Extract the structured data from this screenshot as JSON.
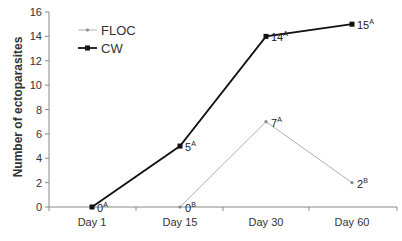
{
  "chart_data": {
    "type": "line",
    "title": "",
    "xlabel": "",
    "ylabel": "Number of ectoparasites",
    "categories": [
      "Day 1",
      "Day 15",
      "Day 30",
      "Day 60"
    ],
    "ylim": [
      0,
      16
    ],
    "yticks": [
      0,
      2,
      4,
      6,
      8,
      10,
      12,
      14,
      16
    ],
    "grid": false,
    "legend_position": "upper-left",
    "series": [
      {
        "name": "FLOC",
        "color": "#b0b0b0",
        "marker": "small-diamond",
        "values": [
          null,
          0,
          7,
          2
        ],
        "labels": [
          "",
          "0B",
          "7A",
          "2B"
        ]
      },
      {
        "name": "CW",
        "color": "#111111",
        "marker": "square",
        "values": [
          0,
          5,
          14,
          15
        ],
        "labels": [
          "0A",
          "5A",
          "14A",
          "15A"
        ]
      }
    ]
  }
}
